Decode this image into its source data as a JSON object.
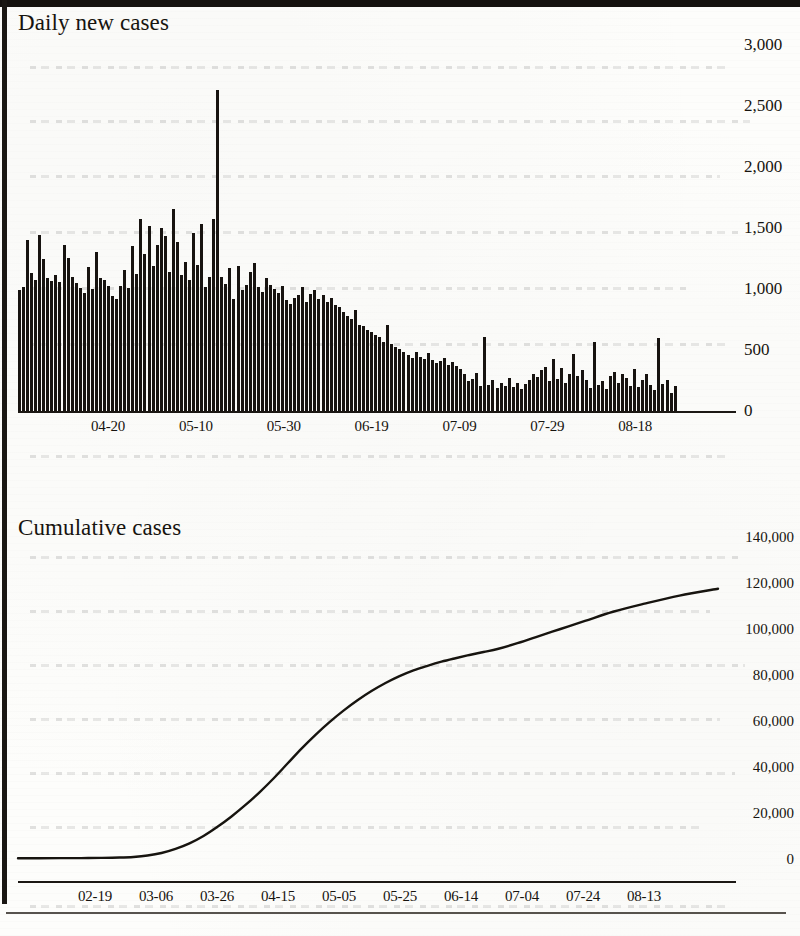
{
  "page": {
    "background_color": "#fdfdfb",
    "ink_color": "#17140f"
  },
  "charts": {
    "daily": {
      "title": "Daily new cases"
    },
    "cumulative": {
      "title": "Cumulative cases"
    }
  },
  "chart_data": [
    {
      "type": "bar",
      "title": "Daily new cases",
      "xlabel": "",
      "ylabel": "",
      "ylim": [
        0,
        3000
      ],
      "ytick_labels": [
        "3,000",
        "2,500",
        "2,000",
        "1,500",
        "1,000",
        "500",
        "0"
      ],
      "ytick_values": [
        3000,
        2500,
        2000,
        1500,
        1000,
        500,
        0
      ],
      "xtick_labels": [
        "04-20",
        "05-10",
        "05-30",
        "06-19",
        "07-09",
        "07-29",
        "08-18"
      ],
      "xtick_indices": [
        20,
        40,
        60,
        80,
        100,
        120,
        140
      ],
      "grid": false,
      "legend": "none",
      "bar_color": "#171310",
      "start_date": "03-31",
      "values": [
        980,
        1005,
        1390,
        1120,
        1060,
        1425,
        1230,
        1075,
        1055,
        1100,
        1050,
        1345,
        1240,
        1090,
        1040,
        1000,
        960,
        1170,
        990,
        1290,
        1080,
        1060,
        1010,
        930,
        905,
        1015,
        1145,
        1000,
        1340,
        1110,
        1560,
        1270,
        1500,
        1175,
        1350,
        1480,
        1420,
        1130,
        1640,
        1370,
        1100,
        1210,
        1060,
        1440,
        1180,
        1515,
        1005,
        1090,
        1560,
        2605,
        1090,
        1030,
        1160,
        905,
        1175,
        980,
        1020,
        1130,
        1200,
        1005,
        965,
        1075,
        1020,
        990,
        960,
        1010,
        900,
        870,
        920,
        940,
        1005,
        880,
        950,
        985,
        905,
        940,
        880,
        915,
        860,
        845,
        800,
        770,
        745,
        820,
        700,
        690,
        660,
        640,
        615,
        600,
        560,
        700,
        540,
        520,
        500,
        480,
        455,
        430,
        475,
        440,
        420,
        470,
        415,
        390,
        405,
        430,
        375,
        400,
        365,
        340,
        300,
        240,
        260,
        310,
        200,
        600,
        210,
        250,
        185,
        230,
        205,
        265,
        195,
        225,
        180,
        215,
        250,
        300,
        275,
        330,
        360,
        240,
        420,
        260,
        350,
        230,
        300,
        465,
        280,
        330,
        250,
        190,
        560,
        210,
        240,
        175,
        280,
        320,
        230,
        300,
        270,
        205,
        340,
        195,
        250,
        300,
        210,
        170,
        590,
        220,
        255,
        150,
        205
      ]
    },
    {
      "type": "line",
      "title": "Cumulative cases",
      "xlabel": "",
      "ylabel": "",
      "ylim": [
        0,
        140000
      ],
      "ytick_labels": [
        "140,000",
        "120,000",
        "100,000",
        "80,000",
        "60,000",
        "40,000",
        "20,000",
        "0"
      ],
      "ytick_values": [
        140000,
        120000,
        100000,
        80000,
        60000,
        40000,
        20000,
        0
      ],
      "xtick_labels": [
        "02-19",
        "03-06",
        "03-26",
        "04-15",
        "05-05",
        "05-25",
        "06-14",
        "07-04",
        "07-24",
        "08-13"
      ],
      "grid": false,
      "legend": "none",
      "line_color": "#17140f",
      "x_norm": [
        0.0,
        0.03,
        0.06,
        0.09,
        0.12,
        0.145,
        0.165,
        0.185,
        0.205,
        0.225,
        0.245,
        0.265,
        0.285,
        0.305,
        0.325,
        0.345,
        0.365,
        0.385,
        0.405,
        0.425,
        0.445,
        0.465,
        0.485,
        0.505,
        0.525,
        0.545,
        0.565,
        0.585,
        0.605,
        0.625,
        0.645,
        0.665,
        0.685,
        0.71,
        0.74,
        0.775,
        0.81,
        0.85,
        0.895,
        0.945,
        1.0
      ],
      "values": [
        300,
        330,
        360,
        400,
        470,
        620,
        900,
        1500,
        2600,
        4400,
        6800,
        10000,
        14000,
        18500,
        23500,
        29000,
        35000,
        41500,
        48000,
        54000,
        59500,
        64500,
        69000,
        73000,
        76500,
        79500,
        82000,
        84000,
        85800,
        87300,
        88700,
        90000,
        91300,
        93500,
        96500,
        100000,
        103500,
        107500,
        111000,
        114500,
        117500
      ]
    }
  ]
}
